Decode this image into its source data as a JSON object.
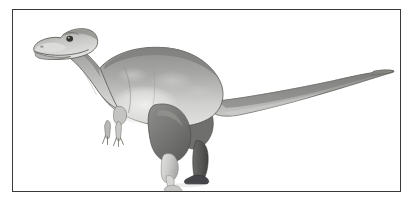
{
  "figure": {
    "frame": {
      "border_color": "#3a3a3a",
      "background_color": "#ffffff",
      "x": 12,
      "y": 9,
      "width": 389,
      "height": 183
    },
    "illustration": {
      "subject": "theropod-dinosaur",
      "subject_label": "Tyrannosaurid theropod dinosaur, left lateral profile",
      "style": "grayscale-shaded-scientific-illustration",
      "orientation": "facing-left",
      "palette": {
        "body_light": "#d8d8d6",
        "body_mid": "#a9a9a7",
        "body_dark": "#7d7d7b",
        "body_darkest": "#5e5e5c",
        "belly_highlight": "#e6e6e4",
        "outline": "#4a4a48",
        "eye": "#2a2a28",
        "background": "#ffffff"
      },
      "parts": [
        {
          "name": "head",
          "note": "boxy theropod skull with jaw line, teeth hint, nostril and dark round eye"
        },
        {
          "name": "neck",
          "note": "thick S-curved neck sloping down from skull to shoulders"
        },
        {
          "name": "torso",
          "note": "deep barrel chest with mottled light belly patch"
        },
        {
          "name": "forelimb",
          "note": "small two-clawed arm hanging below chest"
        },
        {
          "name": "thigh",
          "note": "massive muscular thigh, darker shading"
        },
        {
          "name": "near-leg",
          "note": "light foreground leg lifted forward with splayed toes"
        },
        {
          "name": "far-leg",
          "note": "dark background leg planted on ground"
        },
        {
          "name": "tail",
          "note": "long tapering tail sweeping right and curving up at tip"
        }
      ]
    }
  }
}
